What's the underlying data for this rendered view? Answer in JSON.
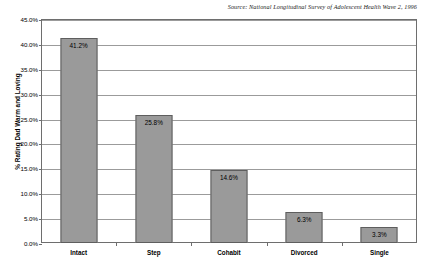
{
  "source": {
    "text": "Source:  National Longitudinal Survey of Adolescent Health Wave 2, 1996"
  },
  "chart_data": {
    "type": "bar",
    "title": "",
    "subtitle": "",
    "categories": [
      "Intact",
      "Step",
      "Cohabit",
      "Divorced",
      "Single"
    ],
    "values": [
      41.2,
      25.8,
      14.6,
      6.3,
      3.3
    ],
    "value_labels": [
      "41.2%",
      "25.8%",
      "14.6%",
      "6.3%",
      "3.3%"
    ],
    "xlabel": "",
    "ylabel": "% Rating Dad Warm and Loving",
    "ylim": [
      0,
      45
    ],
    "ytick_values": [
      45.0,
      40.0,
      35.0,
      30.0,
      25.0,
      20.0,
      15.0,
      10.0,
      5.0,
      0.0
    ],
    "ytick_labels": [
      "45.0%",
      "40.0%",
      "35.0%",
      "30.0%",
      "25.0%",
      "20.0%",
      "15.0%",
      "10.0%",
      "5.0%",
      "0.0%"
    ],
    "grid": true,
    "legend": false,
    "legend_position": "none",
    "bar_color": "#9a9a9a",
    "bar_border_color": "#5e5e5e",
    "gridline_color": "#9b9b9b",
    "frame_color": "#6e6e6e",
    "background_color": "#ffffff"
  }
}
